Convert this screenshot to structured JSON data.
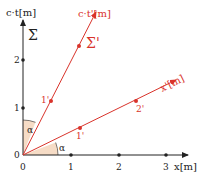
{
  "diagram": {
    "colors": {
      "axis": "#222222",
      "primed": "#d9332b",
      "angle_fill": "#f6dcc6"
    },
    "axes": {
      "x_label": "x[m]",
      "ct_label": "c·t[m]",
      "x_prime_label": "x'[m]",
      "ct_prime_label": "c·t'[m]",
      "frame_label": "Σ",
      "frame_prime_label": "Σ'"
    },
    "ticks": {
      "x": [
        "0",
        "1",
        "2",
        "3"
      ],
      "ct": [
        "0",
        "1",
        "2"
      ],
      "x_prime": [
        "1'",
        "2'"
      ],
      "ct_prime": [
        "1'"
      ]
    },
    "angles": {
      "between_ct_ctprime": "α",
      "between_x_xprime": "α"
    }
  }
}
